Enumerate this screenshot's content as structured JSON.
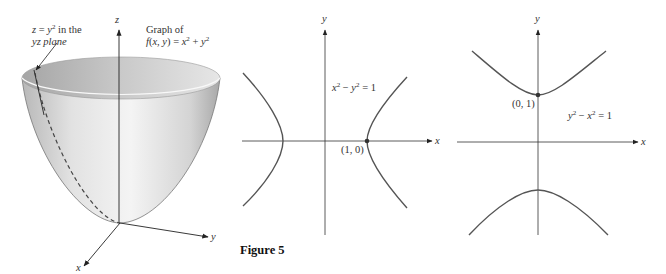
{
  "figure": {
    "caption": "Figure 5",
    "panels": [
      {
        "id": "paraboloid",
        "title_line1": "Graph of",
        "function_label": "f(x, y) = x² + y²",
        "trace_line1": "z = y² in the",
        "trace_line2": "yz plane",
        "axes": {
          "z": "z",
          "y": "y",
          "x": "x"
        }
      },
      {
        "id": "hyperbola-horizontal",
        "equation": "x² − y² = 1",
        "point_label": "(1, 0)",
        "axes": {
          "x": "x",
          "y": "y"
        }
      },
      {
        "id": "hyperbola-vertical",
        "equation": "y² − x² = 1",
        "point_label": "(0, 1)",
        "axes": {
          "x": "x",
          "y": "y"
        }
      }
    ]
  },
  "colors": {
    "curve": "#555555",
    "axis": "#333333",
    "surface_light": "#f2f2f2",
    "surface_dark": "#9a9a9a"
  }
}
